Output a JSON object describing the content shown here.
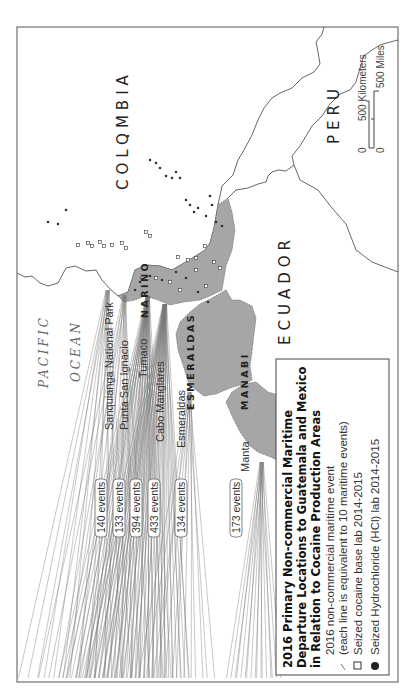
{
  "map": {
    "title_lines": [
      "2016 Primary Non-commercial Maritime",
      "Departure Locations to Guatemala and Mexico",
      "in Relation to Cocaine Production Areas"
    ],
    "orientation": "rotated 90 degrees counter-clockwise",
    "countries": [
      "COLOMBIA",
      "ECUADOR",
      "PERU"
    ],
    "ocean_label": [
      "PACIFIC",
      "OCEAN"
    ],
    "departments": [
      "NARIÑO",
      "ESMERALDAS",
      "MANABI"
    ],
    "departure_points": [
      {
        "name": "Sanquianga National Park",
        "events": "140 events",
        "count": 140
      },
      {
        "name": "Punta San Ignacio",
        "events": "133 events",
        "count": 133
      },
      {
        "name": "Tumaco",
        "events": "394 events",
        "count": 394
      },
      {
        "name": "Cabo Manglares",
        "events": "433 events",
        "count": 433
      },
      {
        "name": "Esmeraldas",
        "events": "134 events",
        "count": 134
      },
      {
        "name": "Manta",
        "events": "173 events",
        "count": 173
      }
    ],
    "legend": {
      "line_item_1": "2016 non-commercial maritime event",
      "line_item_2": "(each line is equivalent to 10 maritime events)",
      "base_lab": "Seized cocaine base lab 2014-2015",
      "hcl_lab": "Seized Hydrochloride (HCl) lab 2014-2015"
    },
    "scale_bar": {
      "km_zero": "0",
      "km_label": "500 Kilometers",
      "mi_zero": "0",
      "mi_label": "500 Miles"
    },
    "colors": {
      "highlight_region": "#a6a6a6",
      "lines": "#777777",
      "border": "#555555"
    }
  }
}
